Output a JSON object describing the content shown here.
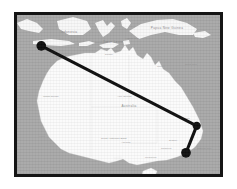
{
  "figure": {
    "frame": {
      "border_color": "#151515",
      "border_width_px": 3,
      "x": 14,
      "y": 12,
      "width": 209,
      "height": 165
    },
    "background_color": "#ffffff"
  },
  "map": {
    "ocean_color": "#a8a8a8",
    "land_color": "#fbfbfb",
    "region": "Australia and the Indonesian archipelago",
    "projection_extent": {
      "west_lon": 95.0,
      "east_lon": 160.0,
      "north_lat": -3.0,
      "south_lat": -45.0
    },
    "country_labels": [
      {
        "name": "Australia",
        "x": 112,
        "y": 92
      },
      {
        "name": "Indonesia",
        "x": 52,
        "y": 18
      },
      {
        "name": "Papua New Guinea",
        "x": 150,
        "y": 14
      },
      {
        "name": "Timor-Leste",
        "x": 96,
        "y": 28
      }
    ],
    "place_labels": [
      {
        "name": "Perth",
        "x": 22,
        "y": 122
      },
      {
        "name": "Adelaide",
        "x": 104,
        "y": 128
      },
      {
        "name": "Melbourne",
        "x": 128,
        "y": 143
      },
      {
        "name": "Sydney",
        "x": 152,
        "y": 126
      },
      {
        "name": "Brisbane",
        "x": 163,
        "y": 104
      },
      {
        "name": "Canberra",
        "x": 144,
        "y": 134
      },
      {
        "name": "Darwin",
        "x": 88,
        "y": 40
      },
      {
        "name": "Cairns",
        "x": 140,
        "y": 52
      },
      {
        "name": "Alice Springs",
        "x": 100,
        "y": 82
      },
      {
        "name": "Hobart",
        "x": 134,
        "y": 160
      }
    ],
    "water_labels": [
      {
        "name": "Indian Ocean",
        "x": 26,
        "y": 82
      },
      {
        "name": "Coral Sea",
        "x": 168,
        "y": 50
      },
      {
        "name": "Timor Sea",
        "x": 78,
        "y": 28
      },
      {
        "name": "Tasman Sea",
        "x": 180,
        "y": 134
      },
      {
        "name": "Great Australian Bight",
        "x": 84,
        "y": 124
      },
      {
        "name": "Arafura Sea",
        "x": 108,
        "y": 24
      }
    ]
  },
  "route": {
    "stroke_color": "#0d0d0d",
    "stroke_width_px": 3,
    "node_color": "#0d0d0d",
    "node_radius_px": 5,
    "points": [
      {
        "label": "origin-marker",
        "x": 39,
        "y": 44,
        "type": "endpoint"
      },
      {
        "label": "waypoint-marker",
        "x": 199,
        "y": 127,
        "type": "vertex"
      },
      {
        "label": "destination-marker",
        "x": 188,
        "y": 155,
        "type": "endpoint"
      }
    ]
  }
}
